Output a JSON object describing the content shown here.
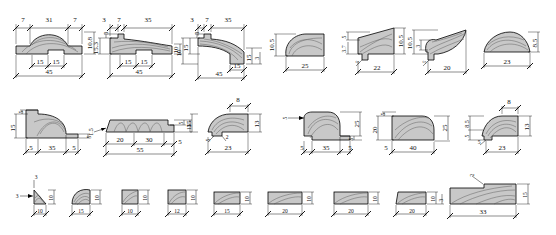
{
  "drawing": {
    "title": "Moulding profile cross-sections dimension sheet",
    "units": "mm",
    "line_color": "#000000",
    "fill_color": "#c8c8c8",
    "hatch_color": "#555555",
    "background": "#ffffff"
  },
  "rows": [
    {
      "name": "row-1",
      "profiles": [
        {
          "name": "profile-1-1",
          "shape": "crowned-cap-with-groove",
          "dims": {
            "top_left": "7",
            "top_mid": "31",
            "top_right": "7",
            "right_v": "10.8",
            "bot_left": "15",
            "bot_right": "15",
            "bot_total": "45"
          }
        },
        {
          "name": "profile-1-2",
          "shape": "tapered-ogee-with-groove",
          "dims": {
            "top_a": "3",
            "top_b": "7",
            "top_c": "35",
            "left_v": "15.3",
            "left_v2": "3",
            "right_v": "10",
            "bot_left": "15",
            "bot_right": "15",
            "bot_total": "45"
          }
        },
        {
          "name": "profile-1-3",
          "shape": "tapered-ogee-stepped",
          "dims": {
            "top_a": "3",
            "top_b": "7",
            "top_c": "35",
            "left_v": "10",
            "left_v2": "15",
            "left_v3": "3",
            "right_v": "15",
            "right_v2": "3",
            "bot_mid": "15",
            "bot_total": "45"
          }
        },
        {
          "name": "profile-1-4",
          "shape": "rounded-nose-wedge",
          "dims": {
            "left_v": "10.5",
            "bot_total": "25"
          }
        },
        {
          "name": "profile-1-5",
          "shape": "wedge-with-rebate",
          "dims": {
            "left_v": "5",
            "left_v2": "3.7",
            "right_v": "10.5",
            "bot_left": "5",
            "bot_total": "22"
          }
        },
        {
          "name": "profile-1-6",
          "shape": "hooked-taper",
          "dims": {
            "left_v": "10.5",
            "left_v2": "3",
            "bot_left": "5",
            "bot_total": "20"
          }
        },
        {
          "name": "profile-1-7",
          "shape": "domed-cap",
          "dims": {
            "right_v": "8.5",
            "bot_total": "23"
          }
        }
      ]
    },
    {
      "name": "row-2",
      "profiles": [
        {
          "name": "profile-2-1",
          "shape": "ovolo-with-rebates",
          "dims": {
            "left_v": "15",
            "left_v2": "5",
            "right_v": "5",
            "bot_left": "5",
            "bot_mid": "35",
            "bot_right": "5"
          }
        },
        {
          "name": "profile-2-2",
          "shape": "flat-reeded-board",
          "dims": {
            "left_v": "1.5",
            "right_v": "5",
            "right_v2": "15",
            "bot_a": "20",
            "bot_b": "30",
            "bot_c": "5",
            "bot_total": "55"
          }
        },
        {
          "name": "profile-2-3",
          "shape": "splayed-cove-block",
          "dims": {
            "top_a": "8",
            "left_v": "15",
            "right_v": "13",
            "bot_a": "5",
            "bot_b": "2",
            "bot_total": "23"
          }
        },
        {
          "name": "profile-2-4",
          "shape": "ovolo-block-rebated",
          "dims": {
            "left_v": "5",
            "right_v": "25",
            "right_v2": "5",
            "bot_left": "5",
            "bot_mid": "35",
            "bot_right": "5"
          }
        },
        {
          "name": "profile-2-5",
          "shape": "round-corner-block",
          "dims": {
            "left_v": "20",
            "left_v2": "5",
            "right_v": "25",
            "bot_left": "5",
            "bot_total": "40"
          }
        },
        {
          "name": "profile-2-6",
          "shape": "cove-corner-block",
          "dims": {
            "top_a": "8",
            "left_v": "8.5",
            "left_v2": "5",
            "right_v": "13",
            "bot_left": "5",
            "bot_total": "23"
          }
        }
      ]
    },
    {
      "name": "row-3",
      "profiles": [
        {
          "name": "profile-3-1",
          "shape": "small-triangle-fillet",
          "dims": {
            "top_a": "3",
            "left_v": "3",
            "right_v": "10",
            "bot_total": "10"
          }
        },
        {
          "name": "profile-3-2",
          "shape": "quarter-round-fillet",
          "dims": {
            "right_v": "10",
            "bot_total": "15"
          }
        },
        {
          "name": "profile-3-3",
          "shape": "square-chamfer-block",
          "dims": {
            "right_v": "10",
            "bot_total": "10"
          }
        },
        {
          "name": "profile-3-4",
          "shape": "square-cove-block",
          "dims": {
            "right_v": "10",
            "bot_total": "12"
          }
        },
        {
          "name": "profile-3-5",
          "shape": "flat-chamfer-bar",
          "dims": {
            "right_v": "10",
            "bot_total": "15"
          }
        },
        {
          "name": "profile-3-6",
          "shape": "flat-bar-wide",
          "dims": {
            "right_v": "10",
            "bot_total": "20"
          }
        },
        {
          "name": "profile-3-7",
          "shape": "flat-bar-wide-2",
          "dims": {
            "right_v": "10",
            "bot_total": "20"
          }
        },
        {
          "name": "profile-3-8",
          "shape": "flat-bar-angled",
          "dims": {
            "right_v": "10",
            "left_v": "3",
            "bot_total": "20"
          }
        },
        {
          "name": "profile-3-9",
          "shape": "wide-stepped-board",
          "dims": {
            "top_a": "2",
            "right_v": "15",
            "bot_total": "33"
          }
        }
      ]
    }
  ]
}
